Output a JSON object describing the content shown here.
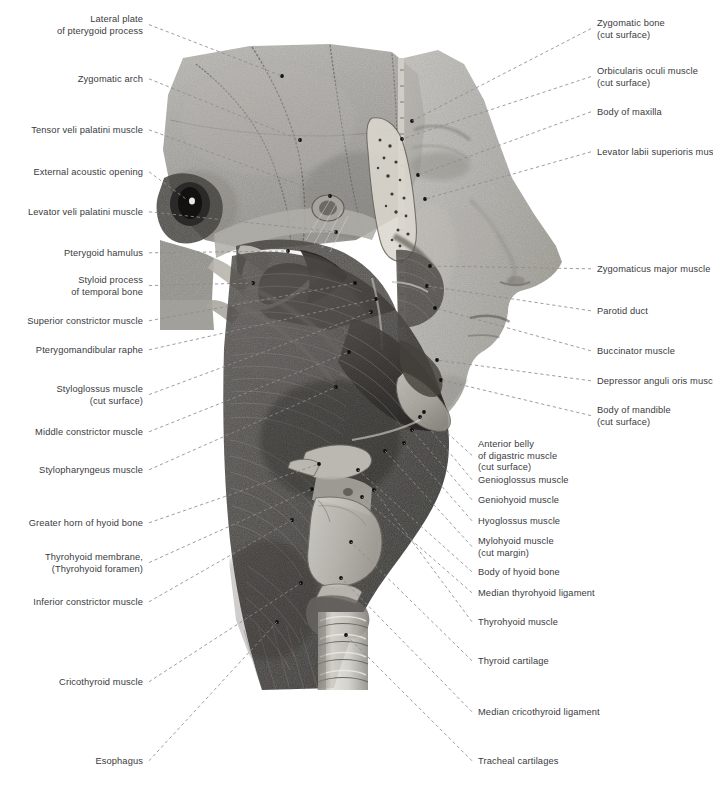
{
  "plate": {
    "title": "Lateral dissection of head and neck — pharyngeal and facial musculature",
    "view": "left lateral view",
    "style": "grayscale anatomical halftone illustration",
    "background_color": "#ffffff",
    "label_text_color": "#3a3a3e",
    "leader_line_color": "#8d8d8d",
    "anchor_dot_color": "#101010",
    "width": 713,
    "height": 789
  },
  "labels_left": [
    {
      "id": "lateral-plate-pterygoid",
      "text": "Lateral plate\nof pterygoid process",
      "x": 143,
      "y": 14,
      "lines": 2,
      "anchor_x": 282,
      "anchor_y": 76
    },
    {
      "id": "zygomatic-arch",
      "text": "Zygomatic arch",
      "x": 143,
      "y": 74,
      "lines": 1,
      "anchor_x": 300,
      "anchor_y": 140
    },
    {
      "id": "tensor-veli-palatini",
      "text": "Tensor veli palatini muscle",
      "x": 143,
      "y": 125,
      "lines": 1,
      "anchor_x": 330,
      "anchor_y": 196
    },
    {
      "id": "external-acoustic-opening",
      "text": "External acoustic opening",
      "x": 143,
      "y": 167,
      "lines": 1,
      "anchor_x": 186,
      "anchor_y": 199
    },
    {
      "id": "levator-veli-palatini",
      "text": "Levator veli palatini muscle",
      "x": 143,
      "y": 207,
      "lines": 1,
      "anchor_x": 336,
      "anchor_y": 232
    },
    {
      "id": "pterygoid-hamulus",
      "text": "Pterygoid hamulus",
      "x": 143,
      "y": 248,
      "lines": 1,
      "anchor_x": 288,
      "anchor_y": 251
    },
    {
      "id": "styloid-process",
      "text": "Styloid process\nof temporal bone",
      "x": 143,
      "y": 275,
      "lines": 2,
      "anchor_x": 253,
      "anchor_y": 283
    },
    {
      "id": "superior-constrictor",
      "text": "Superior constrictor muscle",
      "x": 143,
      "y": 316,
      "lines": 1,
      "anchor_x": 355,
      "anchor_y": 283
    },
    {
      "id": "pterygomandibular-raphe",
      "text": "Pterygomandibular raphe",
      "x": 143,
      "y": 345,
      "lines": 1,
      "anchor_x": 376,
      "anchor_y": 299
    },
    {
      "id": "styloglossus",
      "text": "Styloglossus muscle\n(cut surface)",
      "x": 143,
      "y": 384,
      "lines": 2,
      "anchor_x": 371,
      "anchor_y": 312
    },
    {
      "id": "middle-constrictor",
      "text": "Middle constrictor muscle",
      "x": 143,
      "y": 427,
      "lines": 1,
      "anchor_x": 349,
      "anchor_y": 352
    },
    {
      "id": "stylopharyngeus",
      "text": "Stylopharyngeus muscle",
      "x": 143,
      "y": 465,
      "lines": 1,
      "anchor_x": 336,
      "anchor_y": 387
    },
    {
      "id": "greater-horn-hyoid",
      "text": "Greater horn of hyoid bone",
      "x": 143,
      "y": 518,
      "lines": 1,
      "anchor_x": 319,
      "anchor_y": 464
    },
    {
      "id": "thyrohyoid-membrane",
      "text": "Thyrohyoid membrane,\n(Thyrohyoid foramen)",
      "x": 143,
      "y": 552,
      "lines": 2,
      "anchor_x": 312,
      "anchor_y": 489
    },
    {
      "id": "inferior-constrictor",
      "text": "Inferior constrictor muscle",
      "x": 143,
      "y": 597,
      "lines": 1,
      "anchor_x": 292,
      "anchor_y": 520
    },
    {
      "id": "cricothyroid",
      "text": "Cricothyroid muscle",
      "x": 143,
      "y": 677,
      "lines": 1,
      "anchor_x": 301,
      "anchor_y": 583
    },
    {
      "id": "esophagus",
      "text": "Esophagus",
      "x": 143,
      "y": 756,
      "lines": 1,
      "anchor_x": 277,
      "anchor_y": 622
    }
  ],
  "labels_right_upper": [
    {
      "id": "zygomatic-bone",
      "text": "Zygomatic bone\n(cut surface)",
      "x": 597,
      "y": 18,
      "lines": 2,
      "anchor_x": 412,
      "anchor_y": 121
    },
    {
      "id": "orbicularis-oculi",
      "text": "Orbicularis oculi muscle\n(cut surface)",
      "x": 597,
      "y": 66,
      "lines": 2,
      "anchor_x": 402,
      "anchor_y": 139
    },
    {
      "id": "body-of-maxilla",
      "text": "Body of maxilla",
      "x": 597,
      "y": 107,
      "lines": 1,
      "anchor_x": 418,
      "anchor_y": 175
    },
    {
      "id": "levator-labii-superioris",
      "text": "Levator labii superioris muscle",
      "x": 597,
      "y": 147,
      "lines": 1,
      "anchor_x": 425,
      "anchor_y": 199
    },
    {
      "id": "zygomaticus-major",
      "text": "Zygomaticus major muscle",
      "x": 597,
      "y": 264,
      "lines": 1,
      "anchor_x": 430,
      "anchor_y": 266
    },
    {
      "id": "parotid-duct",
      "text": "Parotid duct",
      "x": 597,
      "y": 306,
      "lines": 1,
      "anchor_x": 427,
      "anchor_y": 286
    },
    {
      "id": "buccinator",
      "text": "Buccinator muscle",
      "x": 597,
      "y": 346,
      "lines": 1,
      "anchor_x": 435,
      "anchor_y": 308
    },
    {
      "id": "depressor-anguli-oris",
      "text": "Depressor anguli oris muscle",
      "x": 597,
      "y": 376,
      "lines": 1,
      "anchor_x": 437,
      "anchor_y": 360
    },
    {
      "id": "body-of-mandible",
      "text": "Body of mandible\n(cut surface)",
      "x": 597,
      "y": 405,
      "lines": 2,
      "anchor_x": 441,
      "anchor_y": 380
    }
  ],
  "labels_right_lower": [
    {
      "id": "anterior-belly-digastric",
      "text": "Anterior belly\nof digastric muscle\n(cut surface)",
      "x": 478,
      "y": 439,
      "lines": 3,
      "anchor_x": 424,
      "anchor_y": 412
    },
    {
      "id": "genioglossus",
      "text": "Genioglossus muscle",
      "x": 478,
      "y": 475,
      "lines": 1,
      "anchor_x": 420,
      "anchor_y": 417
    },
    {
      "id": "geniohyoid",
      "text": "Geniohyoid muscle",
      "x": 478,
      "y": 495,
      "lines": 1,
      "anchor_x": 412,
      "anchor_y": 430
    },
    {
      "id": "hyoglossus",
      "text": "Hyoglossus muscle",
      "x": 478,
      "y": 516,
      "lines": 1,
      "anchor_x": 404,
      "anchor_y": 443
    },
    {
      "id": "mylohyoid",
      "text": "Mylohyoid muscle\n(cut margin)",
      "x": 478,
      "y": 536,
      "lines": 2,
      "anchor_x": 385,
      "anchor_y": 451
    },
    {
      "id": "body-of-hyoid",
      "text": "Body of hyoid bone",
      "x": 478,
      "y": 567,
      "lines": 1,
      "anchor_x": 358,
      "anchor_y": 470
    },
    {
      "id": "median-thyrohyoid-ligament",
      "text": "Median thyrohyoid ligament",
      "x": 478,
      "y": 588,
      "lines": 1,
      "anchor_x": 362,
      "anchor_y": 497
    },
    {
      "id": "thyrohyoid-muscle",
      "text": "Thyrohyoid muscle",
      "x": 478,
      "y": 617,
      "lines": 1,
      "anchor_x": 374,
      "anchor_y": 490
    },
    {
      "id": "thyroid-cartilage",
      "text": "Thyroid cartilage",
      "x": 478,
      "y": 656,
      "lines": 1,
      "anchor_x": 351,
      "anchor_y": 542
    },
    {
      "id": "median-cricothyroid-ligament",
      "text": "Median cricothyroid ligament",
      "x": 478,
      "y": 707,
      "lines": 1,
      "anchor_x": 341,
      "anchor_y": 578
    },
    {
      "id": "tracheal-cartilages",
      "text": "Tracheal cartilages",
      "x": 478,
      "y": 756,
      "lines": 1,
      "anchor_x": 346,
      "anchor_y": 635
    }
  ]
}
